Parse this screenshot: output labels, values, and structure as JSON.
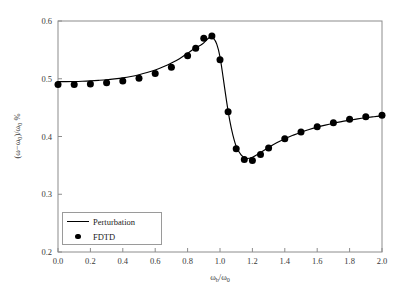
{
  "figure": {
    "background_color": "#ffffff",
    "frame_color": "#8c8c8c",
    "ink_color": "#000000"
  },
  "axes": {
    "x_title_prefix": "ω",
    "x_title_sub1": "b",
    "x_title_mid": "/ω",
    "x_title_sub2": "0",
    "y_title": "(ω−ω",
    "y_title_sub1": "0",
    "y_title_mid": ")/ω",
    "y_title_sub2": "0",
    "y_title_suffix": " %"
  },
  "chart_data": {
    "type": "line",
    "title": "",
    "xlabel": "ω_b/ω_0",
    "ylabel": "(ω−ω_0)/ω_0 %",
    "xlim": [
      0.0,
      2.0
    ],
    "ylim": [
      0.2,
      0.6
    ],
    "xticks": [
      0.0,
      0.2,
      0.4,
      0.6,
      0.8,
      1.0,
      1.2,
      1.4,
      1.6,
      1.8,
      2.0
    ],
    "xtick_labels": [
      "0.0",
      "0.2",
      "0.4",
      "0.6",
      "0.8",
      "1.0",
      "1.2",
      "1.4",
      "1.6",
      "1.8",
      "2.0"
    ],
    "yticks": [
      0.2,
      0.3,
      0.4,
      0.5,
      0.6
    ],
    "ytick_labels": [
      "0.2",
      "0.3",
      "0.4",
      "0.5",
      "0.6"
    ],
    "grid": false,
    "legend_position": "lower-left-inside",
    "series": [
      {
        "name": "Perturbation",
        "style": "line",
        "color": "#000000",
        "x": [
          0.0,
          0.05,
          0.1,
          0.15,
          0.2,
          0.25,
          0.3,
          0.35,
          0.4,
          0.45,
          0.5,
          0.55,
          0.6,
          0.65,
          0.7,
          0.75,
          0.8,
          0.84,
          0.88,
          0.9,
          0.92,
          0.94,
          0.96,
          0.98,
          1.0,
          1.02,
          1.04,
          1.06,
          1.08,
          1.1,
          1.13,
          1.16,
          1.2,
          1.25,
          1.3,
          1.35,
          1.4,
          1.45,
          1.5,
          1.55,
          1.6,
          1.65,
          1.7,
          1.75,
          1.8,
          1.85,
          1.9,
          1.95,
          2.0
        ],
        "y": [
          0.495,
          0.4951,
          0.4953,
          0.4957,
          0.4963,
          0.4972,
          0.4983,
          0.4998,
          0.5016,
          0.504,
          0.507,
          0.5107,
          0.5152,
          0.5207,
          0.5272,
          0.5348,
          0.544,
          0.552,
          0.558,
          0.562,
          0.568,
          0.572,
          0.57,
          0.56,
          0.538,
          0.501,
          0.462,
          0.428,
          0.402,
          0.383,
          0.368,
          0.362,
          0.364,
          0.372,
          0.381,
          0.389,
          0.396,
          0.402,
          0.4075,
          0.412,
          0.4162,
          0.4198,
          0.423,
          0.4258,
          0.4282,
          0.4305,
          0.4325,
          0.4342,
          0.4358
        ]
      },
      {
        "name": "FDTD",
        "style": "markers",
        "color": "#000000",
        "x": [
          0.0,
          0.1,
          0.2,
          0.3,
          0.4,
          0.5,
          0.6,
          0.7,
          0.8,
          0.85,
          0.9,
          0.95,
          1.0,
          1.05,
          1.1,
          1.15,
          1.2,
          1.25,
          1.3,
          1.4,
          1.5,
          1.6,
          1.7,
          1.8,
          1.9,
          2.0
        ],
        "y": [
          0.49,
          0.49,
          0.491,
          0.493,
          0.496,
          0.501,
          0.509,
          0.52,
          0.54,
          0.553,
          0.57,
          0.574,
          0.533,
          0.443,
          0.379,
          0.36,
          0.3585,
          0.369,
          0.38,
          0.396,
          0.408,
          0.417,
          0.424,
          0.43,
          0.434,
          0.437
        ]
      }
    ]
  },
  "legend": {
    "entries": [
      {
        "label": "Perturbation",
        "key": "line-key"
      },
      {
        "label": "FDTD",
        "key": "dot-key"
      }
    ]
  }
}
